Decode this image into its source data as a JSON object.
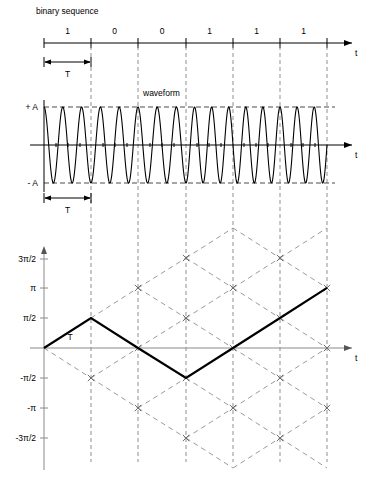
{
  "figure": {
    "width": 371,
    "height": 492,
    "background": "#ffffff"
  },
  "binary_panel": {
    "title": "binary sequence",
    "axis_label": "t",
    "interval_label": "T",
    "bits": [
      "1",
      "0",
      "0",
      "1",
      "1",
      "1"
    ]
  },
  "waveform_panel": {
    "title": "waveform",
    "axis_label": "t",
    "interval_label": "T",
    "amplitude_top_label": "+ A",
    "amplitude_bottom_label": "- A"
  },
  "phase_panel": {
    "axis_label": "t",
    "interval_label": "T",
    "y_ticks": [
      "3π/2",
      "π",
      "π/2",
      "-π/2",
      "-π",
      "-3π/2"
    ]
  },
  "colors": {
    "ink": "#000000",
    "grid_dashed": "#8f8f8f",
    "trellis_dashed": "#9a9a9a",
    "phase_axis": "#8a8a8a"
  },
  "chart_data": {
    "type": "line",
    "xlabel": "t",
    "ylabel": "phase",
    "bit_period_T": 1,
    "x": [
      0,
      1,
      2,
      3,
      4,
      5,
      6
    ],
    "x_pixels": [
      44,
      91,
      138,
      186,
      233,
      280,
      327
    ],
    "bits": [
      "1",
      "0",
      "0",
      "1",
      "1",
      "1"
    ],
    "phase_levels_label": [
      "3π/2",
      "π",
      "π/2",
      "0",
      "-π/2",
      "-π",
      "-3π/2"
    ],
    "phase_levels_value": [
      4.712,
      3.142,
      1.571,
      0,
      -1.571,
      -3.142,
      -4.712
    ],
    "series": [
      {
        "name": "actual phase trajectory",
        "style": "solid-bold",
        "x": [
          0,
          1,
          2,
          3,
          4,
          5,
          6
        ],
        "values_label": [
          "0",
          "π/2",
          "0",
          "-π/2",
          "0",
          "π/2",
          "π"
        ],
        "values": [
          0,
          1.571,
          0,
          -1.571,
          0,
          1.571,
          3.142
        ]
      },
      {
        "name": "trellis alternative paths",
        "style": "dashed",
        "description": "full phase trellis lattice of ±π/2 increments per bit period"
      }
    ],
    "waveform": {
      "name": "modulated carrier",
      "amplitude_labels": [
        "+ A",
        "- A"
      ],
      "amplitude": 1,
      "approx_cycles_per_bit": [
        2.5,
        2.5,
        2.5,
        2.75,
        2.75,
        2.75
      ]
    },
    "ylim": [
      -4.712,
      4.712
    ],
    "xlim": [
      0,
      6
    ],
    "grid": true,
    "legend": null
  }
}
